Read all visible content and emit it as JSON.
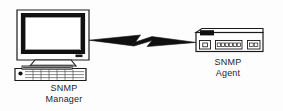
{
  "diagram": {
    "type": "network-topology",
    "background_color": "#fdfdfd",
    "stroke_color": "#1a1a1a",
    "text_color": "#262626",
    "nodes": [
      {
        "id": "snmp-manager",
        "icon": "desktop-computer-icon",
        "label_line1": "SNMP",
        "label_line2": "Manager",
        "parts": [
          "crt-monitor",
          "monitor-stand",
          "keyboard"
        ]
      },
      {
        "id": "snmp-agent",
        "icon": "network-router-icon",
        "label_line1": "SNMP",
        "label_line2": "Agent",
        "parts": [
          "chassis",
          "display-panel",
          "port-group-left",
          "port-group-center",
          "port-group-right"
        ]
      }
    ],
    "links": [
      {
        "id": "manager-agent-link",
        "from": "snmp-manager",
        "to": "snmp-agent",
        "style": "lightning-bolt",
        "label": ""
      }
    ]
  }
}
